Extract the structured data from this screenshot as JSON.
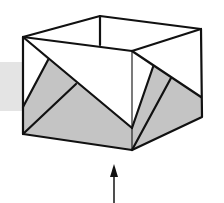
{
  "diagram": {
    "colors": {
      "background": "#ffffff",
      "line": "#111111",
      "paper_white": "#ffffff",
      "paper_gray": "#c4c4c4",
      "backdrop_gray": "#e4e4e4"
    },
    "backdrop": {
      "x": 0,
      "y": 62,
      "w": 23,
      "h": 49
    },
    "vertices": {
      "top_left": [
        23,
        37
      ],
      "top_back": [
        100,
        16
      ],
      "back_inner": [
        100,
        45
      ],
      "top_right": [
        201,
        29
      ],
      "top_front": [
        132,
        51
      ],
      "front_inner": [
        132,
        128
      ],
      "bottom_front": [
        132,
        150
      ],
      "bottom_left": [
        23,
        134
      ],
      "left_mid": [
        23,
        107
      ],
      "right_mid": [
        201,
        97
      ],
      "bottom_right": [
        202,
        117
      ],
      "left_fold_a": [
        48,
        60
      ],
      "left_fold_b": [
        76,
        84
      ],
      "right_fold_a": [
        153,
        67
      ],
      "right_fold_b": [
        171,
        78
      ]
    },
    "arrow": {
      "x": 114,
      "tip_y": 165,
      "tail_y": 203,
      "direction": "up"
    }
  }
}
